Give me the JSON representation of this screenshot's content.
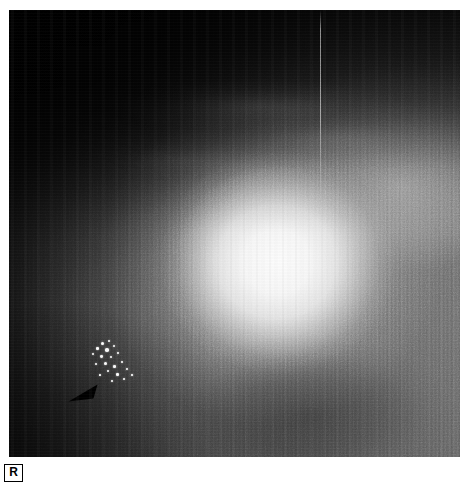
{
  "image": {
    "kind": "radiograph-plate",
    "modality_view": "mammogram",
    "width": 451,
    "height": 447,
    "offset_x": 9,
    "offset_y": 10,
    "background_color": "#ffffff",
    "plate_base_color": "#0a0a0a"
  },
  "annotations": {
    "laterality": {
      "label": "R",
      "name": "laterality-marker",
      "position": {
        "x": 4,
        "y": 464
      },
      "box_size": {
        "width": 19,
        "height": 18
      },
      "border_color": "#000000",
      "text_color": "#000000",
      "background_color": "#ffffff"
    },
    "pointer": {
      "name": "arrowhead-marker",
      "shape": "solid-triangle",
      "points_toward": "left",
      "color": "#000000",
      "position": {
        "x": 59,
        "y": 373
      },
      "size": {
        "width": 30,
        "height": 22
      }
    }
  },
  "features": {
    "central_mass": {
      "name": "central-bright-mass",
      "center": {
        "x": 268,
        "y": 252
      },
      "radius_x": 128,
      "radius_y": 122,
      "peak_color": "#ffffff"
    },
    "mass_halo": {
      "name": "mass-halo",
      "center": {
        "x": 262,
        "y": 250
      },
      "radius_x": 196,
      "radius_y": 188,
      "color": "#ebebeb"
    },
    "upper_right_band": {
      "name": "upper-right-bright-band",
      "center": {
        "x": 392,
        "y": 176
      },
      "radius_x": 180,
      "radius_y": 118,
      "color": "#e2e2e2"
    },
    "dark_upper_left": {
      "name": "upper-left-dark-field",
      "color": "#000000"
    },
    "artifact_line": {
      "name": "vertical-artifact-line",
      "x": 311,
      "top": 0,
      "height": 196,
      "color": "#e1e1e1"
    },
    "calcification_cluster": {
      "name": "microcalcification-cluster",
      "position": {
        "x": 74,
        "y": 324
      },
      "size": {
        "width": 76,
        "height": 56
      },
      "color": "#ffffff",
      "specks": [
        {
          "x": 18,
          "y": 8,
          "d": 3.2
        },
        {
          "x": 25,
          "y": 6,
          "d": 2.4
        },
        {
          "x": 13,
          "y": 13,
          "d": 2.6
        },
        {
          "x": 22,
          "y": 14,
          "d": 3.6
        },
        {
          "x": 30,
          "y": 11,
          "d": 2.2
        },
        {
          "x": 9,
          "y": 19,
          "d": 2.0
        },
        {
          "x": 17,
          "y": 21,
          "d": 2.8
        },
        {
          "x": 27,
          "y": 22,
          "d": 2.3
        },
        {
          "x": 34,
          "y": 18,
          "d": 1.9
        },
        {
          "x": 21,
          "y": 28,
          "d": 3.0
        },
        {
          "x": 12,
          "y": 29,
          "d": 2.1
        },
        {
          "x": 30,
          "y": 31,
          "d": 2.5
        },
        {
          "x": 38,
          "y": 27,
          "d": 2.0
        },
        {
          "x": 24,
          "y": 36,
          "d": 2.2
        },
        {
          "x": 33,
          "y": 39,
          "d": 2.6
        },
        {
          "x": 43,
          "y": 34,
          "d": 1.8
        },
        {
          "x": 16,
          "y": 40,
          "d": 1.7
        },
        {
          "x": 40,
          "y": 44,
          "d": 2.1
        },
        {
          "x": 48,
          "y": 40,
          "d": 1.6
        },
        {
          "x": 28,
          "y": 46,
          "d": 1.9
        }
      ]
    }
  }
}
